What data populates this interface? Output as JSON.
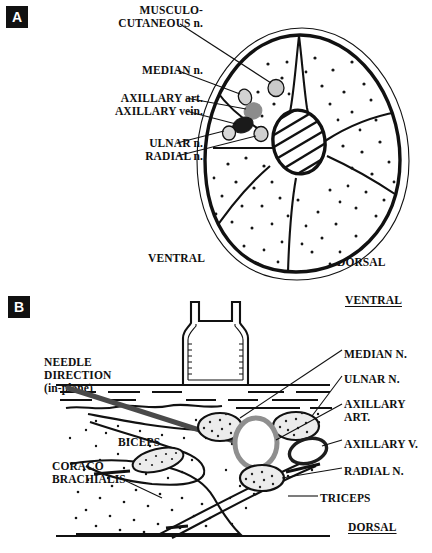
{
  "figure": {
    "type": "anatomical-diagram",
    "panels": [
      "A",
      "B"
    ]
  },
  "panelA": {
    "badge": "A",
    "view": "cross-section",
    "labels": [
      {
        "id": "musculocutaneous",
        "line1": "MUSCULO-",
        "line2": "CUTANEOUS n."
      },
      {
        "id": "median",
        "text": "MEDIAN n."
      },
      {
        "id": "axillary_artery",
        "text": "AXILLARY art."
      },
      {
        "id": "axillary_vein",
        "text": "AXILLARY vein."
      },
      {
        "id": "ulnar",
        "text": "ULNAR n."
      },
      {
        "id": "radial",
        "text": "RADIAL n."
      }
    ],
    "orientation": {
      "left": "VENTRAL",
      "right": "DORSAL"
    },
    "structures": [
      {
        "id": "musculocutaneous-nerve",
        "shade": "#c9c9c9"
      },
      {
        "id": "median-nerve",
        "shade": "#d2d2d2"
      },
      {
        "id": "axillary-artery",
        "shade": "#8c8c8c"
      },
      {
        "id": "axillary-vein",
        "shade": "#1a1a1a"
      },
      {
        "id": "ulnar-nerve",
        "shade": "#d8d8d8"
      },
      {
        "id": "radial-nerve",
        "shade": "#d0d0d0"
      },
      {
        "id": "humerus",
        "shade": "hatched"
      }
    ]
  },
  "panelB": {
    "badge": "B",
    "view": "ultrasound-needle-approach",
    "orientation_top": "VENTRAL",
    "orientation_bottom": "DORSAL",
    "probe": {
      "line1": "USG",
      "line2": "PROBE"
    },
    "needle": {
      "line1": "NEEDLE",
      "line2": "DIRECTION",
      "line3": "(in-plane)",
      "color": "#4a4a4a"
    },
    "muscles": [
      {
        "id": "biceps",
        "text": "BICEPS"
      },
      {
        "id": "coracobrachialis",
        "line1": "CORACO",
        "line2": "BRACHIALIS"
      },
      {
        "id": "triceps",
        "text": "TRICEPS"
      }
    ],
    "right_labels": [
      {
        "id": "median",
        "text": "MEDIAN N."
      },
      {
        "id": "ulnar",
        "text": "ULNAR N."
      },
      {
        "id": "axillary_art",
        "line1": "AXILLARY",
        "line2": "ART."
      },
      {
        "id": "axillary_v",
        "text": "AXILLARY V."
      },
      {
        "id": "radial",
        "text": "RADIAL N."
      }
    ],
    "structures": [
      {
        "id": "median-nerve",
        "shade": "#ececec"
      },
      {
        "id": "ulnar-nerve",
        "shade": "#ececec"
      },
      {
        "id": "radial-nerve",
        "shade": "#ececec"
      },
      {
        "id": "axillary-artery",
        "shade": "#8f8f8f"
      },
      {
        "id": "axillary-vein",
        "shade": "#ffffff"
      },
      {
        "id": "musculocutaneous-nerve",
        "shade": "#ececec"
      }
    ]
  }
}
